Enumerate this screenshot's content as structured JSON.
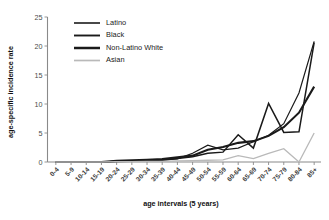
{
  "chart_data": {
    "type": "line",
    "title": "",
    "xlabel": "age intervals (5 years)",
    "ylabel": "age-specific incidence rate",
    "ylim": [
      0,
      25
    ],
    "yticks": [
      0,
      5,
      10,
      15,
      20,
      25
    ],
    "grid": false,
    "legend_position": "top-left-inside",
    "categories": [
      "0-4",
      "5-9",
      "10-14",
      "15-19",
      "20-24",
      "25-29",
      "30-34",
      "35-39",
      "40-44",
      "45-49",
      "50-54",
      "55-59",
      "60-64",
      "65-69",
      "70-74",
      "75-79",
      "80-84",
      "85+"
    ],
    "series": [
      {
        "name": "Latino",
        "color": "#1a1a1a",
        "width": 1.2,
        "values": [
          0,
          0,
          0,
          0,
          0.15,
          0.1,
          0.25,
          0.3,
          0.55,
          1.5,
          2.9,
          2.1,
          2.4,
          3.5,
          4.6,
          6.6,
          11.9,
          20.8
        ]
      },
      {
        "name": "Black",
        "color": "#1a1a1a",
        "width": 1.5,
        "values": [
          0,
          0,
          0,
          0,
          0.1,
          0.15,
          0.2,
          0.35,
          0.6,
          0.9,
          1.5,
          1.7,
          4.7,
          2.4,
          10.1,
          5.1,
          5.2,
          20.6
        ]
      },
      {
        "name": "Non-Latino White",
        "color": "#1a1a1a",
        "width": 2.1,
        "values": [
          0,
          0,
          0,
          0,
          0.2,
          0.3,
          0.4,
          0.5,
          0.8,
          1.1,
          2.1,
          2.6,
          3.3,
          3.6,
          4.5,
          6.0,
          8.5,
          13.0
        ]
      },
      {
        "name": "Asian",
        "color": "#b9b9b9",
        "width": 1.3,
        "values": [
          0,
          0,
          0,
          0,
          0.05,
          0.05,
          0.1,
          0.1,
          0.2,
          0.25,
          0.3,
          0.35,
          1.1,
          0.6,
          1.5,
          2.3,
          0.0,
          5.0
        ]
      }
    ]
  },
  "legend": {
    "items": [
      {
        "label": "Latino"
      },
      {
        "label": "Black"
      },
      {
        "label": "Non-Latino White"
      },
      {
        "label": "Asian"
      }
    ]
  }
}
